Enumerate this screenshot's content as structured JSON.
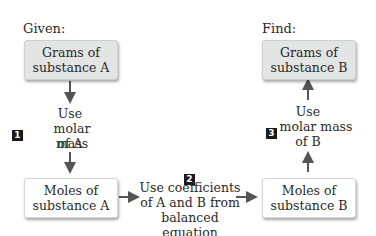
{
  "labels": {
    "given": "Given:",
    "find": "Find:"
  },
  "boxes": {
    "grams_a": {
      "line1": "Grams of",
      "line2": "substance A"
    },
    "moles_a": {
      "line1": "Moles of",
      "line2": "substance A"
    },
    "moles_b": {
      "line1": "Moles of",
      "line2": "substance B"
    },
    "grams_b": {
      "line1": "Grams of",
      "line2": "substance B"
    }
  },
  "steps": [
    {
      "number": "1",
      "line1": "Use",
      "line2": "molar mass",
      "line3": "of A"
    },
    {
      "number": "2",
      "line1": "Use coefficients",
      "line2": "of A and B from",
      "line3": "balanced equation"
    },
    {
      "number": "3",
      "line1": "Use",
      "line2": "molar mass",
      "line3": "of B"
    }
  ],
  "colors": {
    "gray_box": "#e3e4e4",
    "white_box": "#ffffff",
    "arrow": "#555555",
    "step_badge": "#1a1a1a"
  }
}
